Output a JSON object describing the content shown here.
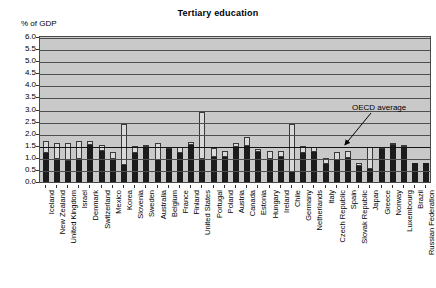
{
  "chart_data": {
    "type": "bar",
    "title": "Tertiary education",
    "ylabel": "% of GDP",
    "xlabel": "",
    "ylim": [
      0,
      6.0
    ],
    "ytick_step": 0.5,
    "yticks": [
      "6.0",
      "5.5",
      "5.0",
      "4.5",
      "4.0",
      "3.5",
      "3.0",
      "2.5",
      "2.0",
      "1.5",
      "1.0",
      "0.5",
      "0.0"
    ],
    "grid": true,
    "legend_position": "none",
    "stacked": true,
    "annotations": [
      {
        "text": "OECD average",
        "value": 1.5,
        "kind": "reference-line"
      }
    ],
    "categories": [
      "Iceland",
      "New Zealand",
      "United Kingdom",
      "Israel",
      "Denmark",
      "Switzerland",
      "Mexico",
      "Korea",
      "Slovenia",
      "Sweden",
      "Australia",
      "Belgium",
      "France",
      "Finland",
      "United States",
      "Portugal",
      "Poland",
      "Austria",
      "Canada",
      "Estonia",
      "Hungary",
      "Ireland",
      "Chile",
      "Germany",
      "Netherlands",
      "Italy",
      "Czech Republic",
      "Spain",
      "Slovak Republic",
      "Japan",
      "Greece",
      "Norway",
      "Luxembourg",
      "Brazil",
      "Russian Federation"
    ],
    "series": [
      {
        "name": "Public expenditure",
        "color": "#1c1c1c",
        "values": [
          1.2,
          0.95,
          0.85,
          0.95,
          1.55,
          1.3,
          0.95,
          0.7,
          1.2,
          1.45,
          0.9,
          1.35,
          1.2,
          1.55,
          0.95,
          1.05,
          1.05,
          1.45,
          1.5,
          1.25,
          0.95,
          1.05,
          0.4,
          1.2,
          1.25,
          0.75,
          0.9,
          1.0,
          0.65,
          0.55,
          1.35,
          1.55,
          1.45,
          0.8,
          0.8
        ]
      },
      {
        "name": "Private expenditure",
        "color": "#d9d9d9",
        "values": [
          0.5,
          0.65,
          0.75,
          0.75,
          0.15,
          0.25,
          0.3,
          1.7,
          0.3,
          0.1,
          0.7,
          0.1,
          0.25,
          0.1,
          1.95,
          0.35,
          0.25,
          0.15,
          0.35,
          0.1,
          0.35,
          0.25,
          2.0,
          0.3,
          0.2,
          0.25,
          0.35,
          0.3,
          0.15,
          0.9,
          0.1,
          0.05,
          0.05,
          0.0,
          0.0
        ]
      }
    ],
    "totals": [
      1.7,
      1.6,
      1.6,
      1.7,
      1.7,
      1.55,
      1.25,
      2.4,
      1.5,
      1.55,
      1.6,
      1.45,
      1.45,
      1.65,
      2.9,
      1.4,
      1.3,
      1.6,
      1.85,
      1.35,
      1.3,
      1.3,
      2.4,
      1.5,
      1.45,
      1.0,
      1.25,
      1.3,
      0.8,
      1.45,
      1.45,
      1.6,
      1.5,
      0.8,
      0.8
    ]
  }
}
